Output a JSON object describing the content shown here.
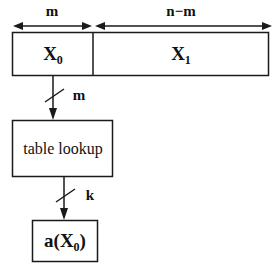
{
  "figure": {
    "stroke_color": "#1a1a1a",
    "background_color": "#ffffff"
  },
  "dimensions": {
    "left_span_label": "m",
    "right_span_label": "n−m"
  },
  "word_register": {
    "left_field": {
      "base": "X",
      "subscript": "0",
      "text": "X0"
    },
    "right_field": {
      "base": "X",
      "subscript": "1",
      "text": "X1"
    }
  },
  "connections": [
    {
      "name": "x0-to-table",
      "width_label": "m",
      "from": "X0",
      "to": "table lookup"
    },
    {
      "name": "table-to-output",
      "width_label": "k",
      "from": "table lookup",
      "to": "a(X0)"
    }
  ],
  "blocks": [
    {
      "name": "table-lookup",
      "label": "table lookup"
    },
    {
      "name": "output",
      "base": "a(X",
      "subscript": "0",
      "tail": ")",
      "text": "a(X0)"
    }
  ]
}
